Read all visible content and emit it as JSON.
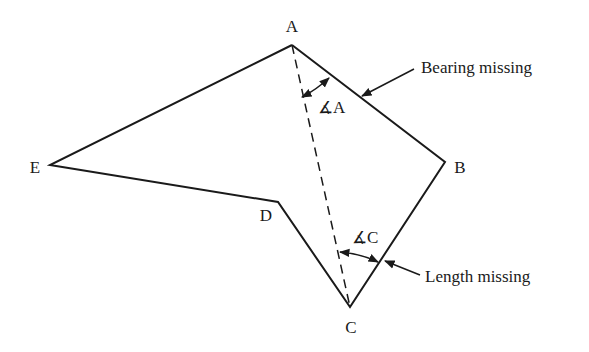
{
  "diagram": {
    "vertices": [
      {
        "id": "A",
        "label": "A",
        "x": 292,
        "y": 45,
        "lx": 292,
        "ly": 32
      },
      {
        "id": "B",
        "label": "B",
        "x": 445,
        "y": 162,
        "lx": 462,
        "ly": 172
      },
      {
        "id": "C",
        "label": "C",
        "x": 350,
        "y": 307,
        "lx": 351,
        "ly": 332
      },
      {
        "id": "D",
        "label": "D",
        "x": 278,
        "y": 202,
        "lx": 265,
        "ly": 220
      },
      {
        "id": "E",
        "label": "E",
        "x": 50,
        "y": 165,
        "lx": 35,
        "ly": 172
      }
    ],
    "angle_labels": {
      "A": "∡A",
      "C": "∡C"
    },
    "annotations": {
      "bearing": "Bearing missing",
      "length": "Length missing"
    },
    "colors": {
      "line": "#1a1a1a",
      "background": "#ffffff"
    }
  }
}
